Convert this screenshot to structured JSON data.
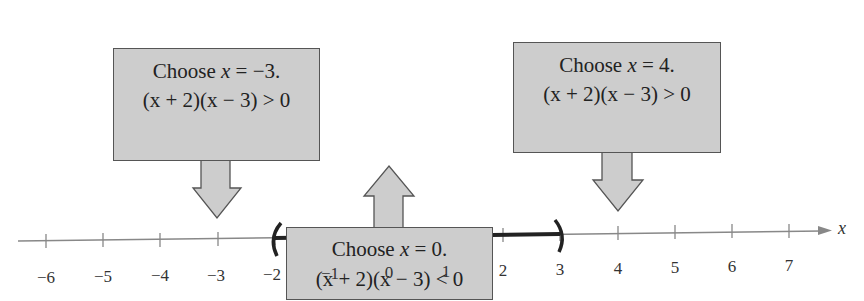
{
  "diagram": {
    "type": "number_line_test_intervals",
    "variable": "x",
    "axis": {
      "min": -6,
      "max": 7,
      "ticks": [
        -6,
        -5,
        -4,
        -3,
        -2,
        -1,
        0,
        1,
        2,
        3,
        4,
        5,
        6,
        7
      ],
      "tick_labels": [
        "−6",
        "−5",
        "−4",
        "−3",
        "−2",
        "−1",
        "0",
        "1",
        "2",
        "3",
        "4",
        "5",
        "6",
        "7"
      ],
      "label": "x"
    },
    "solution_interval": {
      "left": -2,
      "right": 3,
      "left_bracket": "(",
      "right_bracket": ")",
      "notation": "(-2, 3)"
    },
    "callouts": [
      {
        "test_value": -3,
        "line1": "Choose x = −3.",
        "line1_pre": "Choose ",
        "line1_var": "x",
        "line1_post": " = −3.",
        "line2": "(x + 2)(x − 3) > 0",
        "position": "above"
      },
      {
        "test_value": 4,
        "line1": "Choose x = 4.",
        "line1_pre": "Choose ",
        "line1_var": "x",
        "line1_post": " = 4.",
        "line2": "(x + 2)(x − 3) > 0",
        "position": "above"
      },
      {
        "test_value": 0,
        "line1": "Choose x = 0.",
        "line1_pre": "Choose ",
        "line1_var": "x",
        "line1_post": " = 0.",
        "line2": "(x + 2)(x − 3) < 0",
        "position": "below"
      }
    ],
    "colors": {
      "box_fill": "#cdcdcd",
      "box_border": "#555555",
      "axis": "#777777",
      "interval": "#222222"
    }
  }
}
